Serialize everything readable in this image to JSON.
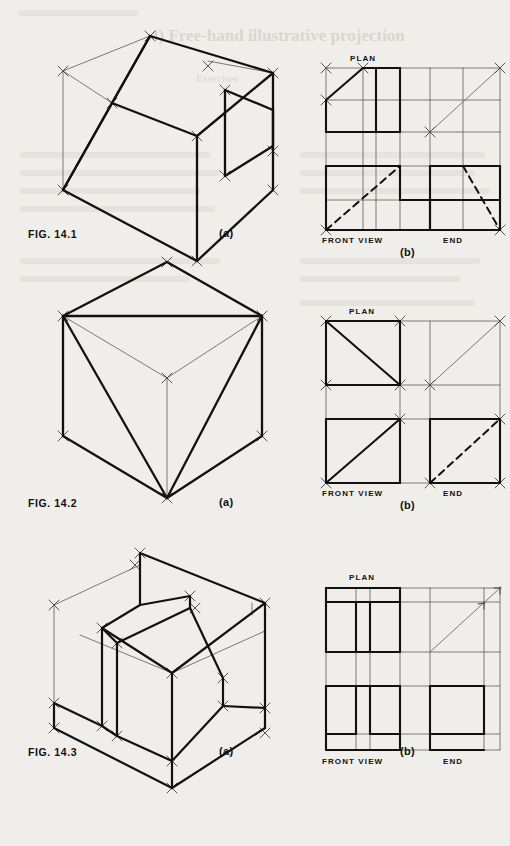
{
  "page": {
    "background_color": "#efeeea",
    "ink_color": "#111111",
    "thin_ink_color": "#5a5a5a",
    "bleed_color": "#d9d6cf",
    "bleed_text": {
      "title": "4) Free-hand illustrative projection",
      "subtitle": "Exercises"
    }
  },
  "figures": [
    {
      "id": "fig-14-1",
      "caption": "FIG. 14.1",
      "views": [
        {
          "id": "fig-14-1-a",
          "label": "(a)",
          "type": "isometric",
          "description": "Cube with an inclined face cut from the top-left edge down to the bottom-front-left corner and a rectangular notch on the right face",
          "labels": []
        },
        {
          "id": "fig-14-1-b",
          "label": "(b)",
          "type": "orthographic",
          "description": "Third-angle style layout: plan above, front view lower-left, end view lower-right, with 45 degree mitre line",
          "labels": [
            "PLAN",
            "FRONT VIEW",
            "END"
          ]
        }
      ]
    },
    {
      "id": "fig-14-2",
      "caption": "FIG. 14.2",
      "views": [
        {
          "id": "fig-14-2-a",
          "label": "(a)",
          "type": "isometric",
          "description": "Cube with the near vertical corner truncated by a triangular plane joining three adjacent corners",
          "labels": []
        },
        {
          "id": "fig-14-2-b",
          "label": "(b)",
          "type": "orthographic",
          "description": "Plan with diagonal, front view with diagonal, end view with hidden dashed diagonal, mitre line at 45 degrees",
          "labels": [
            "PLAN",
            "FRONT VIEW",
            "END"
          ]
        }
      ]
    },
    {
      "id": "fig-14-3",
      "caption": "FIG. 14.3",
      "views": [
        {
          "id": "fig-14-3-a",
          "label": "(a)",
          "type": "isometric",
          "description": "Cube with a deep rectangular channel cut through from front to back leaving a stepped block",
          "labels": []
        },
        {
          "id": "fig-14-3-b",
          "label": "(b)",
          "type": "orthographic",
          "description": "Plan showing two slot lines, front view with slot, end view plain rectangle, mitre line at 45 degrees",
          "labels": [
            "PLAN",
            "FRONT VIEW",
            "END"
          ]
        }
      ]
    }
  ],
  "view_labels": {
    "plan": "PLAN",
    "front_view": "FRONT VIEW",
    "end": "END",
    "a": "(a)",
    "b": "(b)"
  }
}
